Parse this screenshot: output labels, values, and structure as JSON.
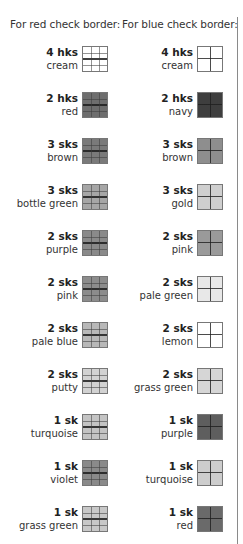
{
  "headers": {
    "red_border": "For red check border:",
    "blue_border": "For blue check border:"
  },
  "red_border_yarns": [
    {
      "qty": "4 hks",
      "color": "cream",
      "swatch": "#ffffff"
    },
    {
      "qty": "2 hks",
      "color": "red",
      "swatch": "#6e6e6e"
    },
    {
      "qty": "3 sks",
      "color": "brown",
      "swatch": "#7a7a7a"
    },
    {
      "qty": "3 sks",
      "color": "bottle green",
      "swatch": "#a6a6a6"
    },
    {
      "qty": "2 sks",
      "color": "purple",
      "swatch": "#8a8a8a"
    },
    {
      "qty": "2 sks",
      "color": "pink",
      "swatch": "#8c8c8c"
    },
    {
      "qty": "2 sks",
      "color": "pale blue",
      "swatch": "#b8b8b8"
    },
    {
      "qty": "2 sks",
      "color": "putty",
      "swatch": "#d2d2d2"
    },
    {
      "qty": "1 sk",
      "color": "turquoise",
      "swatch": "#c4c4c4"
    },
    {
      "qty": "1 sk",
      "color": "violet",
      "swatch": "#8a8a8a"
    },
    {
      "qty": "1 sk",
      "color": "grass green",
      "swatch": "#c8c8c8"
    }
  ],
  "blue_border_yarns": [
    {
      "qty": "4 hks",
      "color": "cream",
      "swatch": "#ffffff"
    },
    {
      "qty": "2 hks",
      "color": "navy",
      "swatch": "#3e3e3e"
    },
    {
      "qty": "3 sks",
      "color": "brown",
      "swatch": "#8e8e8e"
    },
    {
      "qty": "3 sks",
      "color": "gold",
      "swatch": "#cfcfcf"
    },
    {
      "qty": "2 sks",
      "color": "pink",
      "swatch": "#9a9a9a"
    },
    {
      "qty": "2 sks",
      "color": "pale green",
      "swatch": "#e8e8e8"
    },
    {
      "qty": "2 sks",
      "color": "lemon",
      "swatch": "#ffffff"
    },
    {
      "qty": "2 sks",
      "color": "grass green",
      "swatch": "#d6d6d6"
    },
    {
      "qty": "1 sk",
      "color": "purple",
      "swatch": "#5e5e5e"
    },
    {
      "qty": "1 sk",
      "color": "turquoise",
      "swatch": "#cdcdcd"
    },
    {
      "qty": "1 sk",
      "color": "red",
      "swatch": "#6a6a6a"
    }
  ]
}
